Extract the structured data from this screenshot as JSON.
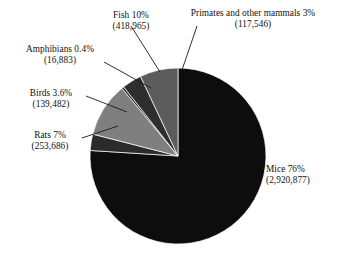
{
  "chart_data": {
    "type": "pie",
    "title": "",
    "subtitle": "",
    "xlabel": "",
    "ylabel": "",
    "legend_position": "none",
    "grid": false,
    "labels_outside": true,
    "leader_lines": true,
    "start_angle_deg": 0,
    "direction": "clockwise",
    "total_count": 3867439,
    "categories": [
      "Mice",
      "Primates and other mammals",
      "Fish",
      "Amphibians",
      "Birds",
      "Rats"
    ],
    "values": [
      76,
      3,
      10,
      0.4,
      3.6,
      7
    ],
    "counts": [
      2920877,
      117546,
      418965,
      16883,
      139482,
      253686
    ],
    "slices": [
      {
        "name": "Mice",
        "percent": 76,
        "percent_text": "76%",
        "count": 2920877,
        "count_text": "(2,920,877)",
        "label_line1": "Mice 76%",
        "label_line2": "(2,920,877)",
        "color": "#0d0d0d"
      },
      {
        "name": "Primates and other mammals",
        "percent": 3,
        "percent_text": "3%",
        "count": 117546,
        "count_text": "(117,546)",
        "label_line1": "Primates and other mammals 3%",
        "label_line2": "(117,546)",
        "color": "#2b2b2b"
      },
      {
        "name": "Fish",
        "percent": 10,
        "percent_text": "10%",
        "count": 418965,
        "count_text": "(418,965)",
        "label_line1": "Fish 10%",
        "label_line2": "(418,965)",
        "color": "#7f7f7f"
      },
      {
        "name": "Amphibians",
        "percent": 0.4,
        "percent_text": "0.4%",
        "count": 16883,
        "count_text": "(16,883)",
        "label_line1": "Amphibians 0.4%",
        "label_line2": "(16,883)",
        "color": "#242424"
      },
      {
        "name": "Birds",
        "percent": 3.6,
        "percent_text": "3.6%",
        "count": 139482,
        "count_text": "(139,482)",
        "label_line1": "Birds 3.6%",
        "label_line2": "(139,482)",
        "color": "#2e2e2e"
      },
      {
        "name": "Rats",
        "percent": 7,
        "percent_text": "7%",
        "count": 253686,
        "count_text": "(253,686)",
        "label_line1": "Rats 7%",
        "label_line2": "(253,686)",
        "color": "#5c5c5c"
      }
    ],
    "geometry": {
      "center_x": 178,
      "center_y": 156,
      "radius": 88
    },
    "colors": {
      "background": "#ffffff",
      "text": "#111111",
      "leader_line": "#1a1a1a"
    }
  }
}
